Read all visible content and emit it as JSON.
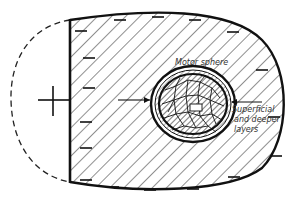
{
  "diagram": {
    "labels": {
      "motor_sphere": "Motor sphere",
      "layers_line1": "Superficial",
      "layers_line2": "and deeper",
      "layers_line3": "layers"
    },
    "polarity": {
      "outside_sign": "+",
      "surface_sign": "−"
    },
    "colors": {
      "ink": "#111111",
      "hatch": "#333333",
      "background": "#ffffff"
    },
    "minus_marks": [
      [
        81,
        31
      ],
      [
        120,
        20
      ],
      [
        158,
        17
      ],
      [
        195,
        20
      ],
      [
        233,
        32
      ],
      [
        262,
        70
      ],
      [
        89,
        58
      ],
      [
        89,
        88
      ],
      [
        86,
        122
      ],
      [
        86,
        148
      ],
      [
        86,
        180
      ],
      [
        113,
        187
      ],
      [
        150,
        190
      ],
      [
        193,
        189
      ],
      [
        234,
        177
      ],
      [
        274,
        117
      ],
      [
        276,
        156
      ]
    ]
  }
}
